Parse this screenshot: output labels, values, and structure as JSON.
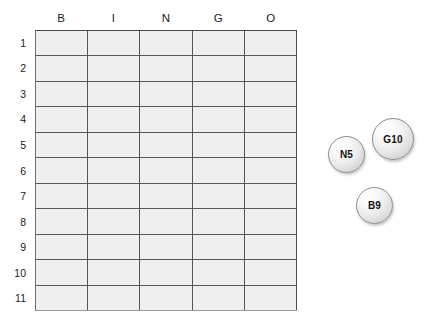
{
  "board": {
    "name": "bingo-board",
    "column_headers": [
      "B",
      "I",
      "N",
      "G",
      "O"
    ],
    "row_labels": [
      "1",
      "2",
      "3",
      "4",
      "5",
      "6",
      "7",
      "8",
      "9",
      "10",
      "11"
    ],
    "rows": 11,
    "columns": 5,
    "cell_fill_color": "#efefef",
    "border_color": "#555555",
    "cells": [
      [
        "",
        "",
        "",
        "",
        ""
      ],
      [
        "",
        "",
        "",
        "",
        ""
      ],
      [
        "",
        "",
        "",
        "",
        ""
      ],
      [
        "",
        "",
        "",
        "",
        ""
      ],
      [
        "",
        "",
        "",
        "",
        ""
      ],
      [
        "",
        "",
        "",
        "",
        ""
      ],
      [
        "",
        "",
        "",
        "",
        ""
      ],
      [
        "",
        "",
        "",
        "",
        ""
      ],
      [
        "",
        "",
        "",
        "",
        ""
      ],
      [
        "",
        "",
        "",
        "",
        ""
      ],
      [
        "",
        "",
        "",
        "",
        ""
      ]
    ]
  },
  "tokens": [
    {
      "label": "G10",
      "column": "G",
      "number": "10",
      "x": 372,
      "y": 118,
      "size": 42
    },
    {
      "label": "N5",
      "column": "N",
      "number": "5",
      "x": 328,
      "y": 136,
      "size": 37
    },
    {
      "label": "B9",
      "column": "B",
      "number": "9",
      "x": 356,
      "y": 187,
      "size": 37
    }
  ]
}
